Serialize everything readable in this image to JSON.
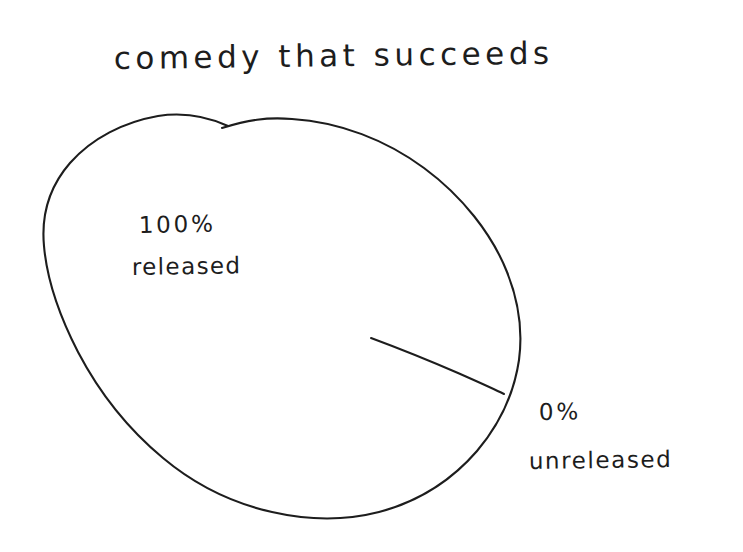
{
  "canvas": {
    "width": 743,
    "height": 552,
    "background_color": "#ffffff",
    "ink_color": "#1d1d1d",
    "style": "hand-drawn pen sketch on white paper"
  },
  "chart_data": {
    "type": "pie",
    "title": "comedy that succeeds",
    "subtitle": "",
    "xlabel": "",
    "ylabel": "",
    "categories": [
      "released",
      "unreleased"
    ],
    "values": [
      100,
      0
    ],
    "unit": "%",
    "slices": [
      {
        "label": "released",
        "value": 100,
        "value_text": "100%",
        "label_text": "released",
        "start_angle_deg": 22.4,
        "end_angle_deg": 382.4,
        "fill": "none",
        "label_position": "inside-upper-left"
      },
      {
        "label": "unreleased",
        "value": 0,
        "value_text": "0%",
        "label_text": "unreleased",
        "start_angle_deg": 22.4,
        "end_angle_deg": 22.4,
        "fill": "none",
        "label_position": "outside-lower-right"
      }
    ],
    "legend": "none",
    "grid": false,
    "data_labels": true
  },
  "title": {
    "text": "comedy that succeeds"
  },
  "labels": {
    "released": {
      "percent": "100%",
      "name": "released"
    },
    "unreleased": {
      "percent": "0%",
      "name": "unreleased"
    }
  },
  "geometry": {
    "pie_center_x": 282,
    "pie_center_y": 318,
    "pie_left_x": 43,
    "pie_right_x": 522,
    "pie_top_y": 118,
    "pie_bottom_y": 518,
    "radius_line_start_x": 372,
    "radius_line_start_y": 339,
    "radius_line_end_x": 503,
    "radius_line_end_y": 393
  }
}
